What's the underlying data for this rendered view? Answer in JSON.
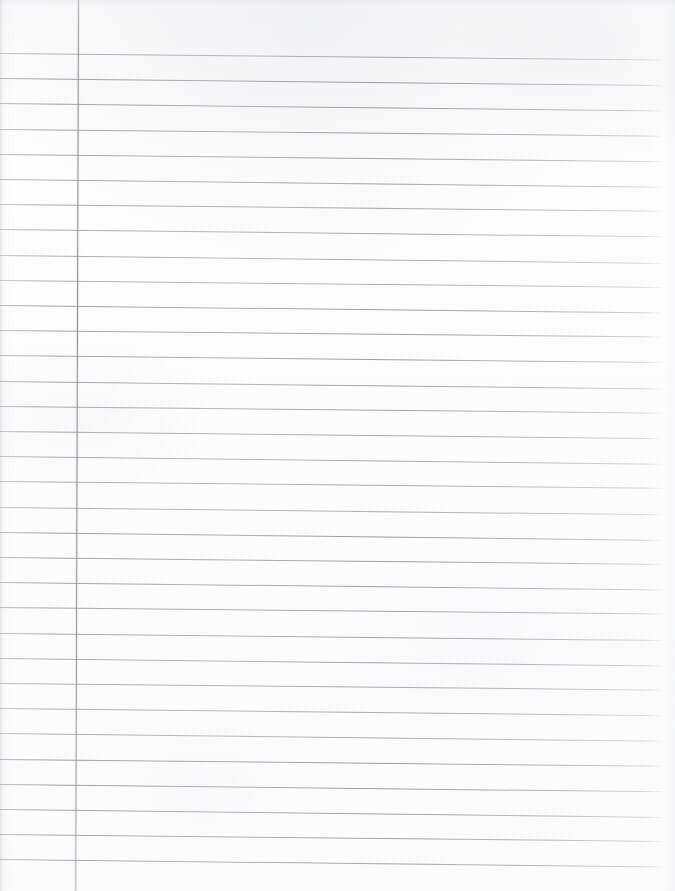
{
  "document": {
    "kind": "scanned-ruled-notebook-page",
    "title": "Blank Lined Notebook Paper",
    "content_text": "",
    "is_blank": true,
    "page_width": 675,
    "page_height": 891
  },
  "paper": {
    "background_color": "#fdfdfd",
    "edge_tint_color": "#e2e4e8"
  },
  "ruling": {
    "style": "college-ruled",
    "line_color": "#8a8d95",
    "line_spacing_px": 25.2,
    "first_line_y_px": 53,
    "line_count": 33,
    "line_left_x_px": 0,
    "line_right_x_px": 664,
    "skew_degrees": 0.62
  },
  "margin_rule": {
    "label": "left-margin-rule",
    "color": "#8c8f98",
    "x_px": 78,
    "top_y_px": 0,
    "bottom_y_px": 891,
    "width_px": 1,
    "skew_degrees": 0.18
  }
}
